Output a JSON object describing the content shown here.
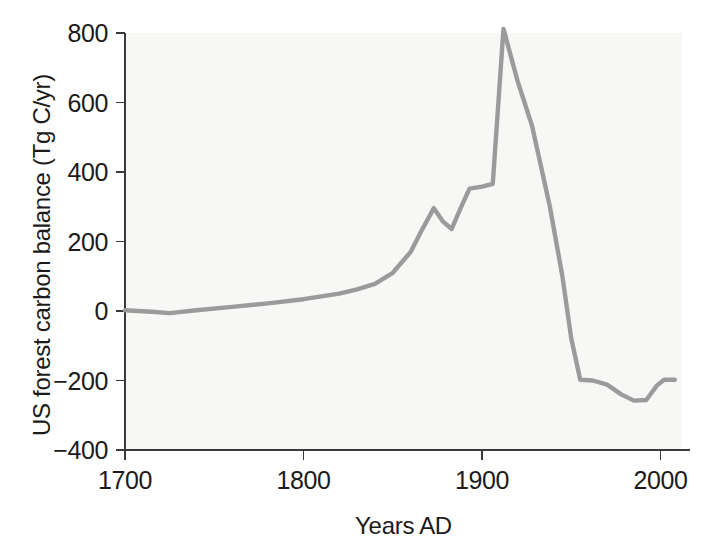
{
  "chart_data": {
    "type": "line",
    "title": "",
    "xlabel": "Years AD",
    "ylabel": "US forest carbon balance (Tg C/yr)",
    "xlim": [
      1700,
      2012
    ],
    "ylim": [
      -400,
      800
    ],
    "xticks": [
      1700,
      1800,
      1900,
      2000
    ],
    "xtick_labels": [
      "1700",
      "1800",
      "1900",
      "2000"
    ],
    "yticks": [
      800,
      600,
      400,
      200,
      0,
      -200,
      -400
    ],
    "ytick_labels": [
      "800",
      "600",
      "400",
      "200",
      "0",
      "−200",
      "−400"
    ],
    "grid": false,
    "legend": null,
    "series": [
      {
        "name": "US forest carbon balance",
        "color": "#9b9b9b",
        "x": [
          1700,
          1715,
          1725,
          1740,
          1760,
          1780,
          1800,
          1820,
          1830,
          1840,
          1850,
          1860,
          1866,
          1873,
          1878,
          1883,
          1888,
          1893,
          1900,
          1906,
          1912,
          1920,
          1928,
          1938,
          1945,
          1950,
          1955,
          1962,
          1970,
          1978,
          1985,
          1992,
          1998,
          2002,
          2008
        ],
        "y": [
          2,
          -2,
          -6,
          2,
          12,
          22,
          34,
          50,
          62,
          78,
          110,
          170,
          230,
          296,
          258,
          236,
          296,
          352,
          358,
          366,
          812,
          660,
          533,
          300,
          100,
          -80,
          -198,
          -200,
          -212,
          -240,
          -258,
          -256,
          -214,
          -198,
          -198
        ]
      }
    ]
  },
  "axis": {
    "x_title": "Years AD",
    "y_title": "US forest carbon balance (Tg C/yr)"
  }
}
